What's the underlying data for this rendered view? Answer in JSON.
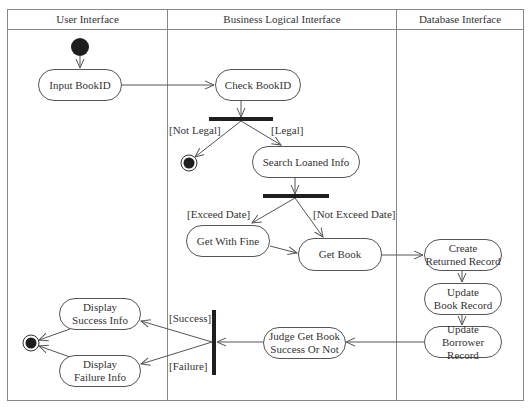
{
  "diagram": {
    "type": "UML activity diagram",
    "colors": {
      "line": "#555555",
      "bar": "#1e1e1e",
      "node_fill": "#ffffff",
      "text": "#333333"
    }
  },
  "lanes": [
    {
      "label": "User Interface"
    },
    {
      "label": "Business Logical Interface"
    },
    {
      "label": "Database Interface"
    }
  ],
  "nodes": {
    "input_bookid": {
      "lines": [
        "Input BookID"
      ]
    },
    "check_bookid": {
      "lines": [
        "Check BookID"
      ]
    },
    "search_loaned_info": {
      "lines": [
        "Search Loaned Info"
      ]
    },
    "get_with_fine": {
      "lines": [
        "Get With Fine"
      ]
    },
    "get_book": {
      "lines": [
        "Get Book"
      ]
    },
    "create_returned_record": {
      "lines": [
        "Create",
        "Returned Record"
      ]
    },
    "update_book_record": {
      "lines": [
        "Update",
        "Book Record"
      ]
    },
    "update_borrower_record": {
      "lines": [
        "Update",
        "Borrower Record"
      ]
    },
    "judge_get_book": {
      "lines": [
        "Judge Get Book",
        "Success Or Not"
      ]
    },
    "display_success_info": {
      "lines": [
        "Display",
        "Success Info"
      ]
    },
    "display_failure_info": {
      "lines": [
        "Display",
        "Failure Info"
      ]
    }
  },
  "guards": {
    "not_legal": "[Not Legal]",
    "legal": "[Legal]",
    "exceed_date": "[Exceed Date]",
    "not_exceed_date": "[Not Exceed Date]",
    "success": "[Success]",
    "failure": "[Failure]"
  }
}
